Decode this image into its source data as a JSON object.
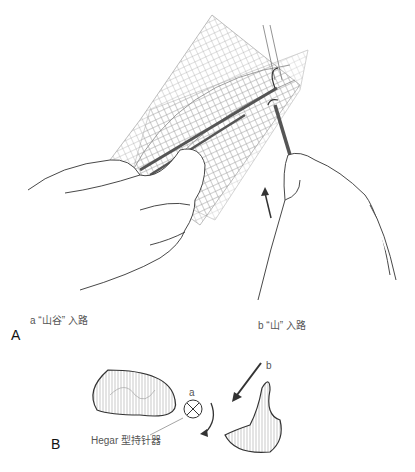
{
  "panels": {
    "a": {
      "letter": "A",
      "label_a": "a “山谷” 入路",
      "label_b": "b “山” 入路"
    },
    "b": {
      "letter": "B",
      "marker_a": "a",
      "marker_b": "b",
      "instrument_label": "Hegar 型持针器"
    }
  },
  "colors": {
    "line": "#333333",
    "mesh": "#9a9a9a",
    "tissue": "#d6d6d6"
  }
}
